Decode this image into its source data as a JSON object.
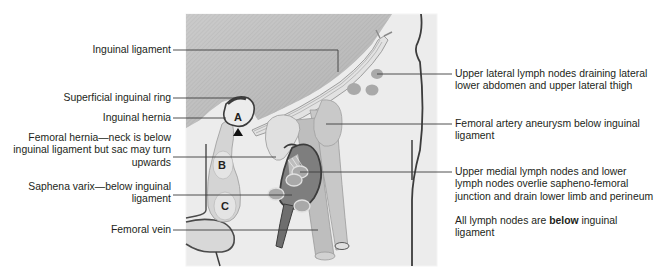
{
  "diagram": {
    "type": "anatomical illustration",
    "colors": {
      "panel_background": "#ebebeb",
      "abdomen_shading": "#b9b9b9",
      "outline": "#3c3c3c",
      "hernia_fill": "#cfcfcf",
      "lymph_node": "#a9a9a9",
      "vessel_fill": "#c4c4c4",
      "dark_varix": "#7d7d7d",
      "leader_line": "#3c3c3c",
      "text": "#231f20"
    },
    "markers": [
      {
        "letter": "A",
        "meaning": "Inguinal hernia"
      },
      {
        "letter": "B",
        "meaning": "Femoral hernia"
      },
      {
        "letter": "C",
        "meaning": "Saphena varix"
      },
      {
        "symbol": "▲",
        "meaning": "Pubic tubercle marker"
      }
    ]
  },
  "labels_left": [
    {
      "id": "inguinal-ligament",
      "lines": [
        "Inguinal ligament"
      ]
    },
    {
      "id": "superficial-inguinal-ring",
      "lines": [
        "Superficial inguinal ring"
      ]
    },
    {
      "id": "inguinal-hernia",
      "lines": [
        "Inguinal hernia"
      ]
    },
    {
      "id": "femoral-hernia",
      "lines": [
        "Femoral hernia—neck is below",
        "inguinal ligament but sac may turn",
        "upwards"
      ]
    },
    {
      "id": "saphena-varix",
      "lines": [
        "Saphena varix—below inguinal",
        "ligament"
      ]
    },
    {
      "id": "femoral-vein",
      "lines": [
        "Femoral vein"
      ]
    }
  ],
  "labels_right": [
    {
      "id": "upper-lateral-lymph-nodes",
      "lines": [
        "Upper lateral lymph nodes draining lateral",
        "lower abdomen and upper lateral thigh"
      ]
    },
    {
      "id": "femoral-artery-aneurysm",
      "lines": [
        "Femoral artery aneurysm below inguinal",
        "ligament"
      ]
    },
    {
      "id": "upper-medial-lymph-nodes",
      "lines": [
        "Upper medial lymph nodes and lower",
        "lymph nodes overlie sapheno-femoral",
        "junction and drain lower limb and perineum"
      ]
    },
    {
      "id": "all-lymph-nodes-note",
      "prefix": "All lymph nodes are ",
      "bold": "below",
      "suffix": " inguinal",
      "line2": "ligament"
    }
  ]
}
